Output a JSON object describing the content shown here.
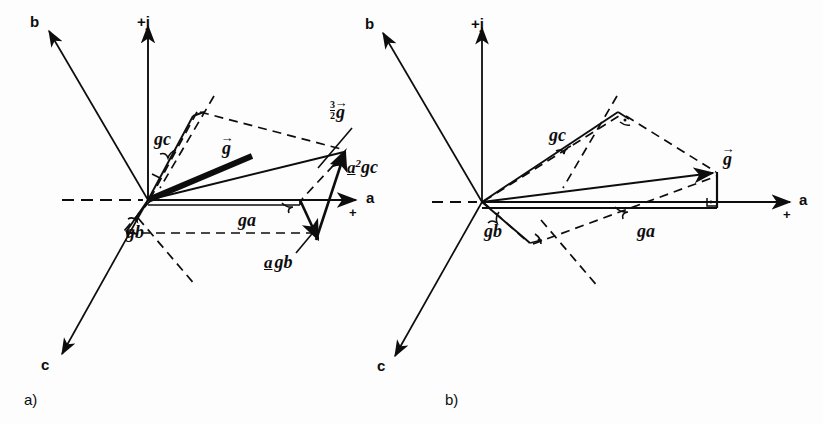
{
  "figure": {
    "kind": "space-vector-construction",
    "panel_captions": [
      "a)",
      "b)"
    ]
  },
  "axes": {
    "imag_positive": "+j",
    "real_positive": "a",
    "real_plus_sign": "+",
    "phase_b": "b",
    "phase_c": "c"
  },
  "panel_a": {
    "caption": "a)",
    "labels": {
      "g_vector": "g",
      "g_c": "g",
      "g_c_sub": "c",
      "g_a": "g",
      "g_a_sub": "a",
      "g_b": "g",
      "g_b_sub": "b",
      "three_halves_g_num": "3",
      "three_halves_g_den": "2",
      "three_halves_g_sym": "g",
      "a_gb_operator": "a",
      "a_gb_sym": "g",
      "a_gb_sub": "b",
      "a2_gc_operator": "a",
      "a2_gc_exponent": "2",
      "a2_gc_sym": "g",
      "a2_gc_sub": "c"
    },
    "geometry": {
      "origin": [
        148,
        200
      ],
      "axis_a_tip": [
        358,
        200
      ],
      "axis_a_dash_end": [
        62,
        200
      ],
      "axis_j_tip": [
        148,
        22
      ],
      "axis_b_tip": [
        46,
        28
      ],
      "axis_c_tip": [
        60,
        358
      ],
      "g_resultant_tip": [
        258,
        152
      ],
      "sum_tip": [
        344,
        152
      ],
      "g_a_end": [
        300,
        200
      ],
      "a_gb_end": [
        318,
        238
      ],
      "g_c_end": [
        196,
        113
      ],
      "g_b_end": [
        124,
        232
      ]
    }
  },
  "panel_b": {
    "caption": "b)",
    "labels": {
      "g_vector": "g",
      "g_c": "g",
      "g_c_sub": "c",
      "g_a": "g",
      "g_a_sub": "a",
      "g_b": "g",
      "g_b_sub": "b"
    },
    "geometry": {
      "origin": [
        482,
        202
      ],
      "axis_a_tip": [
        792,
        202
      ],
      "axis_a_dash_end": [
        432,
        202
      ],
      "axis_j_tip": [
        482,
        24
      ],
      "axis_b_tip": [
        482,
        30
      ],
      "axis_c_tip": [
        492,
        358
      ],
      "g_tip": [
        716,
        172
      ],
      "g_a_foot": [
        716,
        202
      ],
      "g_c_tip": [
        620,
        115
      ],
      "g_b_tip": [
        524,
        240
      ]
    }
  },
  "colors": {
    "ink": "#0d0d0d",
    "paper": "#fdfdfd"
  }
}
